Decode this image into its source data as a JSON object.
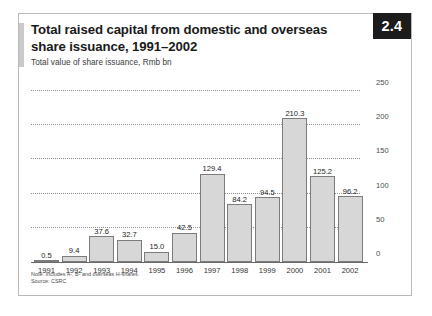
{
  "figure": {
    "badge": "2.4",
    "title": "Total raised capital from domestic and overseas share issuance, 1991–2002",
    "subtitle": "Total value of share issuance, Rmb bn",
    "note": "Note: Includes A-, B- and overseas H-shares.",
    "source": "Source: CSRC"
  },
  "colors": {
    "bar_fill": "#d7d7d7",
    "bar_border": "#7c7c7c",
    "badge_bg": "#1c1c1c",
    "accent": "#c9c9c9",
    "gridline": "#8d8d8d",
    "frame": "#b9b9b9"
  },
  "chart_data": {
    "type": "bar",
    "title": "Total raised capital from domestic and overseas share issuance, 1991–2002",
    "subtitle": "Total value of share issuance, Rmb bn",
    "xlabel": "",
    "ylabel": "Rmb bn",
    "ylim": [
      0,
      250
    ],
    "yticks": [
      0,
      50,
      100,
      150,
      200,
      250
    ],
    "grid": true,
    "legend": "none",
    "categories": [
      "1991",
      "1992",
      "1993",
      "1994",
      "1995",
      "1996",
      "1997",
      "1998",
      "1999",
      "2000",
      "2001",
      "2002"
    ],
    "values": [
      0.5,
      9.4,
      37.6,
      32.7,
      15.0,
      42.5,
      129.4,
      84.2,
      94.5,
      210.3,
      125.2,
      96.2
    ],
    "value_labels": [
      "0.5",
      "9.4",
      "37.6",
      "32.7",
      "15.0",
      "42.5",
      "129.4",
      "84.2",
      "94.5",
      "210.3",
      "125.2",
      "96.2"
    ],
    "notes": [
      "Note: Includes A-, B- and overseas H-shares.",
      "Source: CSRC"
    ]
  }
}
